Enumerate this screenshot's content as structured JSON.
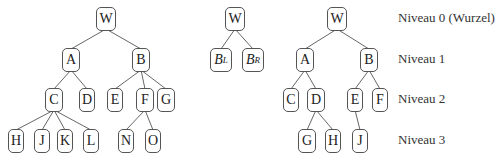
{
  "figure": {
    "trees": [
      {
        "name": "general-tree",
        "nodes": [
          {
            "id": "W",
            "label": "W",
            "level": 0,
            "x": 106,
            "w": 20
          },
          {
            "id": "A",
            "label": "A",
            "level": 1,
            "x": 71,
            "w": 18
          },
          {
            "id": "B",
            "label": "B",
            "level": 1,
            "x": 141,
            "w": 18
          },
          {
            "id": "C",
            "label": "C",
            "level": 2,
            "x": 54,
            "w": 18
          },
          {
            "id": "D",
            "label": "D",
            "level": 2,
            "x": 87,
            "w": 16
          },
          {
            "id": "E",
            "label": "E",
            "level": 2,
            "x": 115,
            "w": 16
          },
          {
            "id": "F",
            "label": "F",
            "level": 2,
            "x": 145,
            "w": 18
          },
          {
            "id": "G",
            "label": "G",
            "level": 2,
            "x": 166,
            "w": 18
          },
          {
            "id": "H",
            "label": "H",
            "level": 3,
            "x": 16,
            "w": 16
          },
          {
            "id": "J",
            "label": "J",
            "level": 3,
            "x": 42,
            "w": 16
          },
          {
            "id": "K",
            "label": "K",
            "level": 3,
            "x": 65,
            "w": 16
          },
          {
            "id": "L",
            "label": "L",
            "level": 3,
            "x": 91,
            "w": 16
          },
          {
            "id": "N",
            "label": "N",
            "level": 3,
            "x": 126,
            "w": 16
          },
          {
            "id": "O",
            "label": "O",
            "level": 3,
            "x": 153,
            "w": 16
          }
        ],
        "edges": [
          [
            "W",
            "A"
          ],
          [
            "W",
            "B"
          ],
          [
            "A",
            "C"
          ],
          [
            "A",
            "D"
          ],
          [
            "B",
            "E"
          ],
          [
            "B",
            "F"
          ],
          [
            "B",
            "G"
          ],
          [
            "C",
            "H"
          ],
          [
            "C",
            "J"
          ],
          [
            "C",
            "K"
          ],
          [
            "C",
            "L"
          ],
          [
            "F",
            "N"
          ],
          [
            "F",
            "O"
          ]
        ]
      },
      {
        "name": "binary-schema",
        "nodes": [
          {
            "id": "W2",
            "label": "W",
            "level": 0,
            "x": 235,
            "w": 20
          },
          {
            "id": "BL",
            "label": "B",
            "sub": "L",
            "level": 1,
            "x": 221,
            "w": 22
          },
          {
            "id": "BR",
            "label": "B",
            "sub": "R",
            "level": 1,
            "x": 253,
            "w": 22
          }
        ],
        "edges": [
          [
            "W2",
            "BL"
          ],
          [
            "W2",
            "BR"
          ]
        ]
      },
      {
        "name": "binary-tree",
        "nodes": [
          {
            "id": "W3",
            "label": "W",
            "level": 0,
            "x": 337,
            "w": 20
          },
          {
            "id": "A3",
            "label": "A",
            "level": 1,
            "x": 305,
            "w": 18
          },
          {
            "id": "B3",
            "label": "B",
            "level": 1,
            "x": 369,
            "w": 18
          },
          {
            "id": "C3",
            "label": "C",
            "level": 2,
            "x": 291,
            "w": 16
          },
          {
            "id": "D3",
            "label": "D",
            "level": 2,
            "x": 316,
            "w": 18
          },
          {
            "id": "E3",
            "label": "E",
            "level": 2,
            "x": 355,
            "w": 16
          },
          {
            "id": "F3",
            "label": "F",
            "level": 2,
            "x": 380,
            "w": 16
          },
          {
            "id": "G3",
            "label": "G",
            "level": 3,
            "x": 307,
            "w": 18
          },
          {
            "id": "H3",
            "label": "H",
            "level": 3,
            "x": 333,
            "w": 16
          },
          {
            "id": "J3",
            "label": "J",
            "level": 3,
            "x": 360,
            "w": 16
          }
        ],
        "edges": [
          [
            "W3",
            "A3"
          ],
          [
            "W3",
            "B3"
          ],
          [
            "A3",
            "C3"
          ],
          [
            "A3",
            "D3"
          ],
          [
            "B3",
            "E3"
          ],
          [
            "B3",
            "F3"
          ],
          [
            "D3",
            "G3"
          ],
          [
            "D3",
            "H3"
          ],
          [
            "E3",
            "J3"
          ]
        ]
      }
    ],
    "level_rows": [
      7,
      48,
      88,
      129
    ],
    "levels": [
      {
        "label": "Niveau 0 (Wurzel)"
      },
      {
        "label": "Niveau 1"
      },
      {
        "label": "Niveau 2"
      },
      {
        "label": "Niveau 3"
      }
    ],
    "colors": {
      "stroke": "#555555",
      "text": "#222222",
      "background": "#ffffff"
    }
  }
}
